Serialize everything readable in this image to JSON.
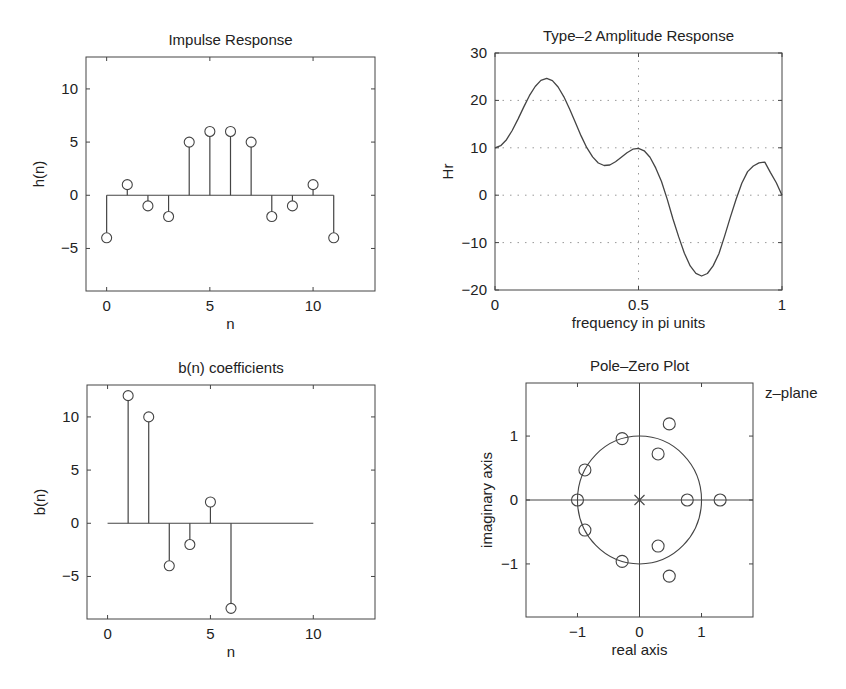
{
  "figure": {
    "background": "#ffffff",
    "line_color": "#444444",
    "grid_color": "#999999"
  },
  "chart_data": [
    {
      "id": "impulse",
      "type": "stem",
      "title": "Impulse Response",
      "xlabel": "n",
      "ylabel": "h(n)",
      "xlim": [
        -1,
        13
      ],
      "ylim": [
        -9,
        13
      ],
      "xticks": [
        0,
        5,
        10
      ],
      "xtick_labels": [
        "0",
        "5",
        "10"
      ],
      "yticks": [
        -5,
        0,
        5,
        10
      ],
      "ytick_labels": [
        "−5",
        "0",
        "5",
        "10"
      ],
      "grid": false,
      "baseline": [
        0,
        11
      ],
      "x": [
        0,
        1,
        2,
        3,
        4,
        5,
        6,
        7,
        8,
        9,
        10,
        11
      ],
      "values": [
        -4,
        1,
        -1,
        -2,
        5,
        6,
        6,
        5,
        -2,
        -1,
        1,
        -4
      ],
      "box": {
        "left": 86,
        "top": 57,
        "right": 375,
        "bottom": 291
      }
    },
    {
      "id": "amplitude",
      "type": "line",
      "title": "Type–2 Amplitude Response",
      "xlabel": "frequency in pi units",
      "ylabel": "Hr",
      "xlim": [
        0,
        1
      ],
      "ylim": [
        -20,
        30
      ],
      "xticks": [
        0,
        0.5,
        1
      ],
      "xtick_labels": [
        "0",
        "0.5",
        "1"
      ],
      "yticks": [
        -20,
        -10,
        0,
        10,
        20,
        30
      ],
      "ytick_labels": [
        "−20",
        "−10",
        "0",
        "10",
        "20",
        "30"
      ],
      "grid": true,
      "grid_x": [
        0.5
      ],
      "grid_y": [
        -10,
        0,
        10,
        20
      ],
      "x": [
        0,
        0.02,
        0.04,
        0.06,
        0.08,
        0.1,
        0.12,
        0.14,
        0.16,
        0.18,
        0.2,
        0.22,
        0.24,
        0.26,
        0.28,
        0.3,
        0.32,
        0.34,
        0.36,
        0.38,
        0.4,
        0.42,
        0.44,
        0.46,
        0.48,
        0.5,
        0.52,
        0.54,
        0.56,
        0.58,
        0.6,
        0.62,
        0.64,
        0.66,
        0.68,
        0.7,
        0.72,
        0.74,
        0.76,
        0.78,
        0.8,
        0.82,
        0.84,
        0.86,
        0.88,
        0.9,
        0.92,
        0.94,
        0.96,
        0.98,
        1.0
      ],
      "values": [
        10,
        10.44,
        11.71,
        13.66,
        16.05,
        18.59,
        20.99,
        22.94,
        24.22,
        24.65,
        24.17,
        22.83,
        20.75,
        18.16,
        15.32,
        12.52,
        10.03,
        8.08,
        6.8,
        6.26,
        6.38,
        7.04,
        7.99,
        8.97,
        9.7,
        9.9,
        9.37,
        8.02,
        5.76,
        2.88,
        -0.83,
        -4.95,
        -8.8,
        -12.23,
        -14.91,
        -16.48,
        -17.05,
        -16.52,
        -14.92,
        -12.34,
        -8.62,
        -4.69,
        -0.84,
        2.51,
        4.97,
        6.17,
        6.81,
        6.98,
        4.77,
        2.63,
        0
      ],
      "box": {
        "left": 495,
        "top": 53,
        "right": 782,
        "bottom": 290
      }
    },
    {
      "id": "bcoef",
      "type": "stem",
      "title": "b(n) coefficients",
      "xlabel": "n",
      "ylabel": "b(n)",
      "xlim": [
        -1,
        13
      ],
      "ylim": [
        -9,
        13
      ],
      "xticks": [
        0,
        5,
        10
      ],
      "xtick_labels": [
        "0",
        "5",
        "10"
      ],
      "yticks": [
        -5,
        0,
        5,
        10
      ],
      "ytick_labels": [
        "−5",
        "0",
        "5",
        "10"
      ],
      "grid": false,
      "baseline": [
        0,
        10
      ],
      "x": [
        1,
        2,
        3,
        4,
        5,
        6
      ],
      "values": [
        12,
        10,
        -4,
        -2,
        2,
        -8
      ],
      "box": {
        "left": 87,
        "top": 385,
        "right": 375,
        "bottom": 619
      }
    },
    {
      "id": "polezero",
      "type": "scatter",
      "title": "Pole–Zero Plot",
      "annotation": "z–plane",
      "xlabel": "real axis",
      "ylabel": "imaginary axis",
      "xlim": [
        -1.83,
        1.83
      ],
      "ylim": [
        -1.83,
        1.83
      ],
      "xticks": [
        -1,
        0,
        1
      ],
      "xtick_labels": [
        "−1",
        "0",
        "1"
      ],
      "yticks": [
        -1,
        0,
        1
      ],
      "ytick_labels": [
        "−1",
        "0",
        "1"
      ],
      "grid": false,
      "unit_circle": true,
      "zeros": [
        [
          -1.0,
          0.0
        ],
        [
          -0.88,
          0.47
        ],
        [
          -0.88,
          -0.47
        ],
        [
          -0.28,
          0.96
        ],
        [
          -0.28,
          -0.96
        ],
        [
          0.3,
          0.72
        ],
        [
          0.3,
          -0.72
        ],
        [
          0.48,
          1.19
        ],
        [
          0.48,
          -1.19
        ],
        [
          0.77,
          0.0
        ],
        [
          1.3,
          0.0
        ]
      ],
      "poles": [
        [
          0,
          0
        ]
      ],
      "pole_multiplicity": 11,
      "box": {
        "left": 526,
        "top": 383,
        "right": 753,
        "bottom": 617
      }
    }
  ]
}
